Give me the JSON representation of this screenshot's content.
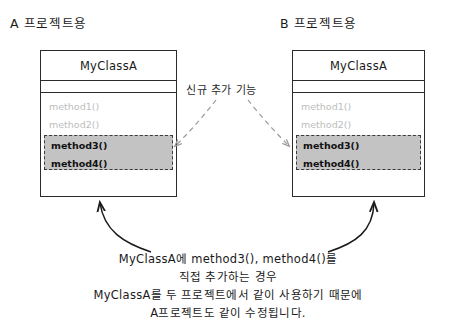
{
  "diagram": {
    "sections": [
      {
        "id": "a",
        "title": "A 프로젝트용"
      },
      {
        "id": "b",
        "title": "B 프로젝트용"
      }
    ],
    "class_box_a": {
      "class_name": "MyClassA",
      "existing_methods": [
        "method1()",
        "method2()"
      ],
      "added_methods": [
        "method3()",
        "method4()"
      ]
    },
    "class_box_b": {
      "class_name": "MyClassA",
      "existing_methods": [
        "method1()",
        "method2()"
      ],
      "added_methods": [
        "method3()",
        "method4()"
      ]
    },
    "center_label": "신규 추가 기능",
    "caption": [
      "MyClassA에 method3(), method4()를",
      "직접 추가하는 경우",
      "MyClassA를 두 프로젝트에서 같이 사용하기 때문에",
      "A프로젝트도 같이 수정됩니다."
    ],
    "colors": {
      "background": "#ffffff",
      "stroke": "#2b2b2b",
      "existing_method_text": "#bdbdbd",
      "added_method_text": "#111111",
      "highlight_fill": "#c3c3c3",
      "dashed_connector": "#9a9a9a",
      "arrow": "#1a1a1a"
    }
  }
}
